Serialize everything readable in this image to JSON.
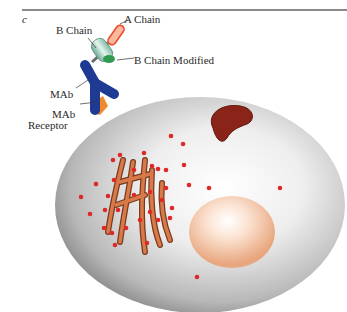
{
  "figure": {
    "panel_label": "c",
    "labels": {
      "a_chain": "A Chain",
      "b_chain": "B Chain",
      "b_chain_modified": "B Chain Modified",
      "mab": "MAb",
      "mab_receptor_line1": "MAb",
      "mab_receptor_line2": "Receptor"
    },
    "colors": {
      "cell_body": "#c8c8c8",
      "cell_edge": "#9a9a9a",
      "antibody": "#1f3a93",
      "receptor": "#f08a2c",
      "a_chain": "#f06040",
      "b_chain": "#a8d8c8",
      "b_chain_modified": "#2f9a50",
      "golgi": "#c8693a",
      "mitochondrion": "#8a2418",
      "nucleus": "#f0c0a0",
      "vesicle": "#e02828"
    }
  }
}
